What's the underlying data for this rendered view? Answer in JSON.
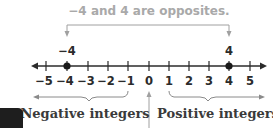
{
  "caption": "−4 and 4 are opposites.",
  "number_line": {
    "ticks": [
      "−5",
      "−4",
      "−3",
      "−2",
      "−1",
      "0",
      "1",
      "2",
      "3",
      "4",
      "5"
    ],
    "highlighted_points": [
      {
        "value": -4,
        "label": "−4"
      },
      {
        "value": 4,
        "label": "4"
      }
    ]
  },
  "labels": {
    "negative": "Negative integers",
    "positive": "Positive integers"
  },
  "colors": {
    "caption": "#a9a9a9",
    "line": "#2b2b2b",
    "annotation": "#9a9a9a"
  }
}
